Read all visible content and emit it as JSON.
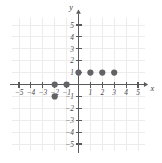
{
  "chart_data": {
    "type": "scatter",
    "title": "",
    "subtitle": "",
    "xlabel": "x",
    "ylabel": "y",
    "xlim": [
      -5.8,
      5.8
    ],
    "ylim": [
      -5.8,
      5.8
    ],
    "grid": true,
    "legend": null,
    "legend_position": "none",
    "x_ticks": [
      -5,
      -4,
      -3,
      -2,
      -1,
      1,
      2,
      3,
      4,
      5
    ],
    "y_ticks": [
      -5,
      -4,
      -3,
      -2,
      -1,
      1,
      2,
      3,
      4,
      5
    ],
    "x_tick_labels": [
      "-5",
      "-4",
      "-3",
      "-2",
      "-1",
      "1",
      "2",
      "3",
      "4",
      "5"
    ],
    "y_tick_labels": [
      "-5",
      "-4",
      "-3",
      "-2",
      "-1",
      "1",
      "2",
      "3",
      "4",
      "5"
    ],
    "points": [
      {
        "x": -2,
        "y": -1
      },
      {
        "x": -2,
        "y": 0
      },
      {
        "x": -1,
        "y": 0
      },
      {
        "x": 0,
        "y": 1
      },
      {
        "x": 1,
        "y": 1
      },
      {
        "x": 2,
        "y": 1
      },
      {
        "x": 3,
        "y": 1
      }
    ],
    "point_color": "#636367",
    "axis_color": "#59595b",
    "grid_color": "#ececec",
    "background_color": "#ffffff"
  },
  "axes": {
    "x_label": "x",
    "y_label": "y"
  }
}
